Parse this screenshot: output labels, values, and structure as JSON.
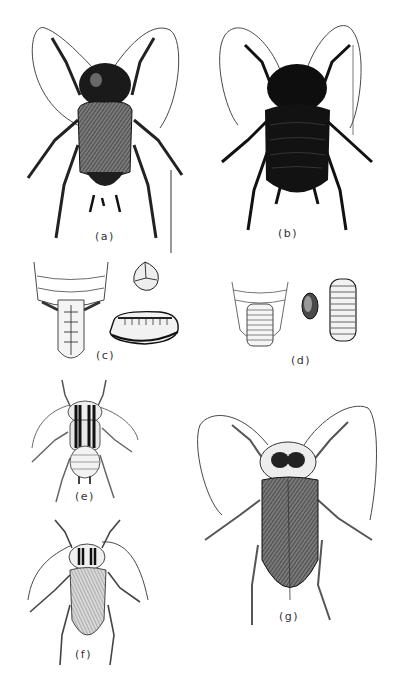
{
  "plate": {
    "figures": [
      {
        "id": "a",
        "label": "(a)",
        "description": "adult cockroach, dorsal view, dark wings"
      },
      {
        "id": "b",
        "label": "(b)",
        "description": "adult cockroach, dorsal view, very dark, short wings"
      },
      {
        "id": "c",
        "label": "(c)",
        "description": "abdomen tip with ootheca, egg, and egg case"
      },
      {
        "id": "d",
        "label": "(d)",
        "description": "abdomen tip with segmented ootheca, egg, and egg case"
      },
      {
        "id": "e",
        "label": "(e)",
        "description": "nymph with striped pronotum"
      },
      {
        "id": "f",
        "label": "(f)",
        "description": "small adult cockroach with striped pronotum"
      },
      {
        "id": "g",
        "label": "(g)",
        "description": "large winged adult cockroach"
      }
    ]
  },
  "colors": {
    "ink": "#1a1a1a",
    "dark_body": "#141414",
    "mid_body": "#3a3a3a",
    "light_body": "#9a9a9a",
    "paper": "#ffffff"
  }
}
